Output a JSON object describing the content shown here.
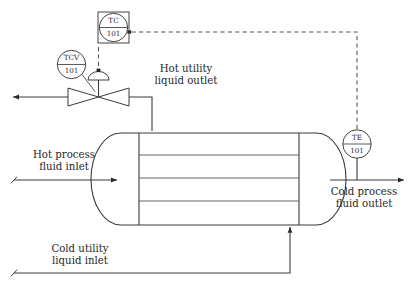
{
  "diagram": {
    "type": "process-flow-diagram",
    "equipment": {
      "heat_exchanger": {
        "name": "shell-and-tube-heat-exchanger",
        "tube_count": 3,
        "tubesheets": 2
      }
    },
    "instruments": [
      {
        "id": "tc-101",
        "function_letters": "TC",
        "tag_number": "101",
        "symbol": "circle-in-square",
        "description": "temperature controller, shared display shared control"
      },
      {
        "id": "tcv-101",
        "function_letters": "TCV",
        "tag_number": "101",
        "symbol": "circle",
        "description": "temperature control valve"
      },
      {
        "id": "te-101",
        "function_letters": "TE",
        "tag_number": "101",
        "symbol": "circle",
        "description": "temperature element"
      }
    ],
    "stream_labels": [
      {
        "id": "hot-utility-liquid-outlet",
        "line1": "Hot utility",
        "line2": "liquid outlet"
      },
      {
        "id": "hot-process-fluid-inlet",
        "line1": "Hot process",
        "line2": "fluid inlet"
      },
      {
        "id": "cold-process-fluid-outlet",
        "line1": "Cold process",
        "line2": "fluid outlet"
      },
      {
        "id": "cold-utility-liquid-inlet",
        "line1": "Cold utility",
        "line2": "liquid inlet"
      }
    ],
    "colors": {
      "background": "#ffffff",
      "line": "#3a3a3a",
      "signal": "#555555",
      "text": "#1f1f1f"
    }
  }
}
